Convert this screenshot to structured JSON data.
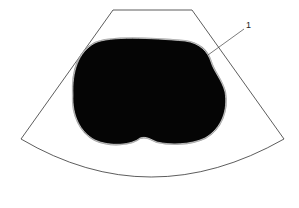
{
  "diagram": {
    "type": "ultrasound-sector-schematic",
    "callouts": [
      {
        "id": "1",
        "label": "1"
      }
    ],
    "colors": {
      "background": "#ffffff",
      "sector_outline": "#333333",
      "lesion_fill": "#050505",
      "lesion_rim": "#9a9a9a",
      "leader_line": "#444444"
    }
  }
}
